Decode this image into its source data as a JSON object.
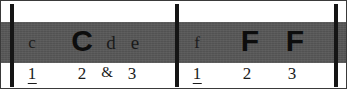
{
  "diagram": {
    "colors": {
      "band": "#575757",
      "barline": "#151515",
      "text_on_band": "#0d0d0d",
      "beat_text": "#1b1b1b",
      "background": "#ffffff",
      "frame": "#3a3a3a"
    },
    "barlines": [
      {
        "name": "opening-barline",
        "x": 9
      },
      {
        "name": "middle-barline",
        "x": 174
      },
      {
        "name": "closing-barline",
        "x": 333
      }
    ],
    "measures": [
      {
        "index": 1,
        "notes": [
          {
            "label": "c",
            "x": 31,
            "size": "small",
            "emphasis": "light"
          },
          {
            "label": "C",
            "x": 81,
            "size": "big",
            "emphasis": "strong"
          },
          {
            "label": "d",
            "x": 110,
            "size": "mid",
            "emphasis": "light"
          },
          {
            "label": "e",
            "x": 134,
            "size": "mid",
            "emphasis": "light"
          }
        ],
        "beats": [
          {
            "label": "1",
            "x": 31,
            "accent": true
          },
          {
            "label": "2",
            "x": 81,
            "accent": false
          },
          {
            "label": "&",
            "x": 106,
            "accent": false
          },
          {
            "label": "3",
            "x": 131,
            "accent": false
          }
        ]
      },
      {
        "index": 2,
        "notes": [
          {
            "label": "f",
            "x": 196,
            "size": "small",
            "emphasis": "light"
          },
          {
            "label": "F",
            "x": 249,
            "size": "big",
            "emphasis": "strong"
          },
          {
            "label": "F",
            "x": 294,
            "size": "big",
            "emphasis": "strong"
          }
        ],
        "beats": [
          {
            "label": "1",
            "x": 196,
            "accent": true
          },
          {
            "label": "2",
            "x": 246,
            "accent": false
          },
          {
            "label": "3",
            "x": 291,
            "accent": false
          }
        ]
      }
    ]
  }
}
